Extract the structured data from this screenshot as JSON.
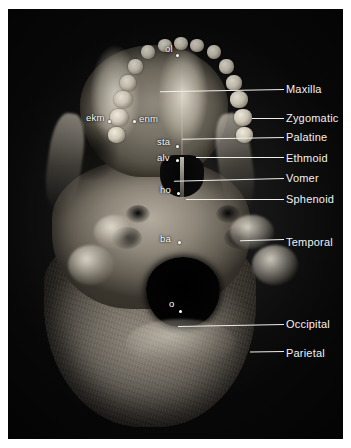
{
  "figure": {
    "kind": "anatomical-photograph",
    "plate_background": "#0d0d0d",
    "label_color": "#f2f2f0",
    "leader_color": "#efeeea",
    "landmark_color": "#ffffff"
  },
  "bone_labels": [
    {
      "name": "maxilla",
      "text": "Maxilla",
      "text_x": 286,
      "text_y": 83,
      "leader_x": 160,
      "leader_y": 89,
      "leader_w": 124,
      "leader_slope": -3
    },
    {
      "name": "zygomatic",
      "text": "Zygomatic",
      "text_x": 286,
      "text_y": 112,
      "leader_x": 252,
      "leader_y": 118,
      "leader_w": 32,
      "leader_slope": 0
    },
    {
      "name": "palatine",
      "text": "Palatine",
      "text_x": 286,
      "text_y": 131,
      "leader_x": 182,
      "leader_y": 137,
      "leader_w": 102,
      "leader_slope": -3
    },
    {
      "name": "ethmoid",
      "text": "Ethmoid",
      "text_x": 286,
      "text_y": 152,
      "leader_x": 196,
      "leader_y": 157,
      "leader_w": 88,
      "leader_slope": 0
    },
    {
      "name": "vomer",
      "text": "Vomer",
      "text_x": 286,
      "text_y": 172,
      "leader_x": 174,
      "leader_y": 178,
      "leader_w": 110,
      "leader_slope": -4
    },
    {
      "name": "sphenoid",
      "text": "Sphenoid",
      "text_x": 286,
      "text_y": 193,
      "leader_x": 186,
      "leader_y": 199,
      "leader_w": 98,
      "leader_slope": 0
    },
    {
      "name": "temporal",
      "text": "Temporal",
      "text_x": 286,
      "text_y": 236,
      "leader_x": 240,
      "leader_y": 239,
      "leader_w": 44,
      "leader_slope": -5
    },
    {
      "name": "occipital",
      "text": "Occipital",
      "text_x": 286,
      "text_y": 318,
      "leader_x": 178,
      "leader_y": 324,
      "leader_w": 106,
      "leader_slope": -3
    },
    {
      "name": "parietal",
      "text": "Parietal",
      "text_x": 286,
      "text_y": 347,
      "leader_x": 250,
      "leader_y": 351,
      "leader_w": 34,
      "leader_slope": -3
    }
  ],
  "landmark_points": [
    {
      "name": "ol",
      "text": "ol",
      "text_x": 165,
      "text_y": 44,
      "dot_x": 176,
      "dot_y": 54
    },
    {
      "name": "ekm",
      "text": "ekm",
      "text_x": 86,
      "text_y": 113,
      "dot_x": 108,
      "dot_y": 120
    },
    {
      "name": "enm",
      "text": "enm",
      "text_x": 139,
      "text_y": 114,
      "dot_x": 133,
      "dot_y": 120
    },
    {
      "name": "sta",
      "text": "sta",
      "text_x": 157,
      "text_y": 137,
      "dot_x": 176,
      "dot_y": 145
    },
    {
      "name": "alv",
      "text": "alv",
      "text_x": 157,
      "text_y": 153,
      "dot_x": 176,
      "dot_y": 159
    },
    {
      "name": "ho",
      "text": "ho",
      "text_x": 160,
      "text_y": 185,
      "dot_x": 177,
      "dot_y": 192
    },
    {
      "name": "ba",
      "text": "ba",
      "text_x": 160,
      "text_y": 234,
      "dot_x": 178,
      "dot_y": 241
    },
    {
      "name": "o",
      "text": "o",
      "text_x": 169,
      "text_y": 299,
      "dot_x": 179,
      "dot_y": 310
    }
  ]
}
